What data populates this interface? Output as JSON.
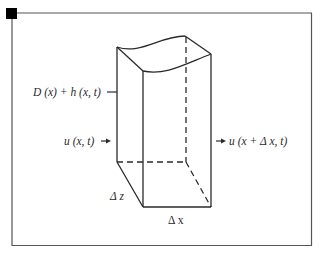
{
  "figure": {
    "type": "control-volume-sketch",
    "labels": {
      "depth": "D (x) + h (x, t)",
      "inflow": "u (x, t)",
      "outflow": "u (x + Δ x, t)",
      "dz": "Δ z",
      "dx": "Δ x"
    },
    "colors": {
      "line": "#2a2a2a",
      "frame": "#555555",
      "corner_marker": "#000000",
      "background": "#ffffff"
    }
  }
}
